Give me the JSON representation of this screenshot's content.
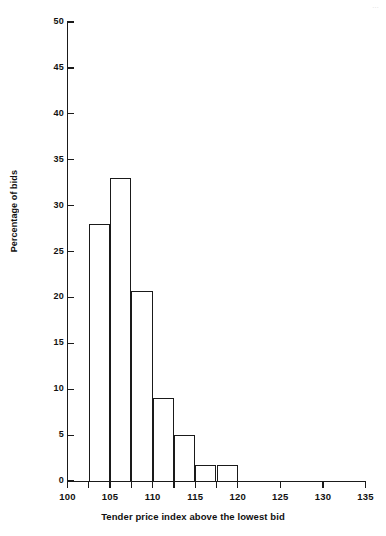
{
  "page": {
    "artifact_mark": "…"
  },
  "chart_data": {
    "type": "bar",
    "title": "",
    "subtitle": "",
    "xlabel": "Tender price index above the lowest bid",
    "ylabel": "Percentage of bids",
    "xlim": [
      100,
      135
    ],
    "ylim": [
      0,
      50
    ],
    "grid": false,
    "legend": false,
    "legend_position": "none",
    "bin_width": 2.5,
    "x_ticks": [
      100,
      105,
      110,
      115,
      120,
      125,
      130,
      135
    ],
    "x_tick_labels": [
      "100",
      "105",
      "110",
      "115",
      "120",
      "125",
      "130",
      "135"
    ],
    "y_ticks": [
      0,
      5,
      10,
      15,
      20,
      25,
      30,
      35,
      40,
      45,
      50
    ],
    "y_tick_labels": [
      "0",
      "5",
      "10",
      "15",
      "20",
      "25",
      "30",
      "35",
      "40",
      "45",
      "50"
    ],
    "x_minor_ticks": [
      102.5,
      107.5,
      112.5,
      117.5
    ],
    "bins": [
      {
        "label": "102.5-105.0",
        "x0": 102.5,
        "x1": 105.0,
        "value": 28.0
      },
      {
        "label": "105.0-107.5",
        "x0": 105.0,
        "x1": 107.5,
        "value": 33.0
      },
      {
        "label": "107.5-110.0",
        "x0": 107.5,
        "x1": 110.0,
        "value": 20.7
      },
      {
        "label": "110.0-112.5",
        "x0": 110.0,
        "x1": 112.5,
        "value": 9.0
      },
      {
        "label": "112.5-115.0",
        "x0": 112.5,
        "x1": 115.0,
        "value": 5.0
      },
      {
        "label": "115.0-117.5",
        "x0": 115.0,
        "x1": 117.5,
        "value": 1.7
      },
      {
        "label": "117.5-120.0",
        "x0": 117.5,
        "x1": 120.0,
        "value": 1.7
      }
    ],
    "categories": [
      "102.5-105.0",
      "105.0-107.5",
      "107.5-110.0",
      "110.0-112.5",
      "112.5-115.0",
      "115.0-117.5",
      "117.5-120.0"
    ],
    "values": [
      28.0,
      33.0,
      20.7,
      9.0,
      5.0,
      1.7,
      1.7
    ],
    "colors": {
      "bar_stroke": "#1a1a1a",
      "bar_fill": "transparent",
      "axis": "#1a1a1a",
      "text": "#111111",
      "background": "#ffffff"
    }
  }
}
